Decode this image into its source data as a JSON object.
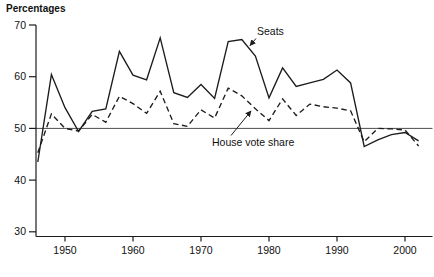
{
  "page": {
    "background": "#ffffff"
  },
  "chart": {
    "y_axis_title": "Percentages",
    "y_ticks": [
      70,
      60,
      50,
      40,
      30
    ],
    "x_ticks": [
      1950,
      1960,
      1970,
      1980,
      1990,
      2000
    ],
    "reference_line": 50,
    "annotations": {
      "seats_label": "Seats",
      "vote_label": "House vote share"
    },
    "colors": {
      "line": "#1c1c1c",
      "ref_line": "#4d4d4d",
      "axis": "#1c1c1c",
      "text": "#111111"
    }
  },
  "chart_data": {
    "type": "line",
    "title": "",
    "xlabel": "",
    "ylabel": "Percentages",
    "ylim": [
      30,
      70
    ],
    "xlim": [
      1945,
      2003.5
    ],
    "grid": false,
    "reference_line_y": 50,
    "legend": "inline-arrow-annotations",
    "x": [
      1946,
      1948,
      1950,
      1952,
      1954,
      1956,
      1958,
      1960,
      1962,
      1964,
      1966,
      1968,
      1970,
      1972,
      1974,
      1976,
      1978,
      1980,
      1982,
      1984,
      1986,
      1988,
      1990,
      1992,
      1994,
      1996,
      1998,
      2000,
      2002
    ],
    "series": [
      {
        "name": "Seats",
        "style": "solid",
        "values": [
          43.5,
          60.4,
          54.0,
          49.4,
          53.3,
          53.8,
          64.9,
          60.3,
          59.4,
          67.5,
          56.9,
          56.0,
          58.5,
          55.8,
          66.8,
          67.2,
          64.0,
          55.9,
          61.7,
          58.1,
          58.8,
          59.5,
          61.3,
          58.8,
          46.5,
          47.8,
          48.8,
          49.2,
          47.6
        ]
      },
      {
        "name": "House vote share",
        "style": "dashed",
        "values": [
          45.3,
          52.8,
          50.0,
          49.5,
          52.7,
          51.2,
          56.2,
          54.8,
          52.9,
          57.2,
          50.9,
          50.4,
          53.6,
          52.0,
          57.8,
          56.3,
          53.8,
          51.5,
          55.7,
          52.5,
          54.7,
          54.2,
          53.9,
          53.4,
          47.4,
          50.0,
          49.9,
          49.7,
          46.6
        ]
      }
    ]
  }
}
